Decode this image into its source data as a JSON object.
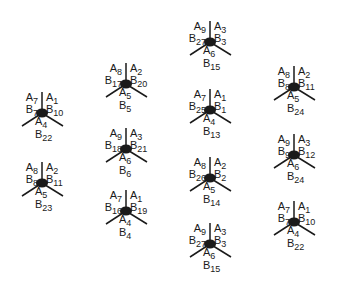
{
  "diagram": {
    "stroke_color": "#1a1a1a",
    "nodes": [
      {
        "x": 42,
        "y": 113,
        "tl": {
          "a": "7",
          "b": "7"
        },
        "tr": {
          "a": "1",
          "b": "10"
        },
        "bottom": {
          "a": "4",
          "b": "22"
        }
      },
      {
        "x": 42,
        "y": 183,
        "tl": {
          "a": "8",
          "b": "8"
        },
        "tr": {
          "a": "2",
          "b": "11"
        },
        "bottom": {
          "a": "5",
          "b": "23"
        }
      },
      {
        "x": 126,
        "y": 84,
        "tl": {
          "a": "8",
          "b": "17"
        },
        "tr": {
          "a": "2",
          "b": "20"
        },
        "bottom": {
          "a": "5",
          "b": "5"
        }
      },
      {
        "x": 126,
        "y": 149,
        "tl": {
          "a": "9",
          "b": "18"
        },
        "tr": {
          "a": "3",
          "b": "21"
        },
        "bottom": {
          "a": "6",
          "b": "6"
        }
      },
      {
        "x": 126,
        "y": 211,
        "tl": {
          "a": "7",
          "b": "16"
        },
        "tr": {
          "a": "1",
          "b": "19"
        },
        "bottom": {
          "a": "4",
          "b": "4"
        }
      },
      {
        "x": 210,
        "y": 42,
        "tl": {
          "a": "9",
          "b": "27"
        },
        "tr": {
          "a": "3",
          "b": "3"
        },
        "bottom": {
          "a": "6",
          "b": "15"
        }
      },
      {
        "x": 210,
        "y": 110,
        "tl": {
          "a": "7",
          "b": "25"
        },
        "tr": {
          "a": "1",
          "b": "1"
        },
        "bottom": {
          "a": "4",
          "b": "13"
        }
      },
      {
        "x": 210,
        "y": 178,
        "tl": {
          "a": "8",
          "b": "26"
        },
        "tr": {
          "a": "2",
          "b": "2"
        },
        "bottom": {
          "a": "5",
          "b": "14"
        }
      },
      {
        "x": 210,
        "y": 244,
        "tl": {
          "a": "9",
          "b": "27"
        },
        "tr": {
          "a": "3",
          "b": "3"
        },
        "bottom": {
          "a": "6",
          "b": "15"
        }
      },
      {
        "x": 294,
        "y": 87,
        "tl": {
          "a": "8",
          "b": "8"
        },
        "tr": {
          "a": "2",
          "b": "11"
        },
        "bottom": {
          "a": "5",
          "b": "24"
        }
      },
      {
        "x": 294,
        "y": 155,
        "tl": {
          "a": "9",
          "b": "9"
        },
        "tr": {
          "a": "3",
          "b": "12"
        },
        "bottom": {
          "a": "6",
          "b": "24"
        }
      },
      {
        "x": 294,
        "y": 222,
        "tl": {
          "a": "7",
          "b": "7"
        },
        "tr": {
          "a": "1",
          "b": "10"
        },
        "bottom": {
          "a": "4",
          "b": "22"
        }
      }
    ]
  },
  "letters": {
    "a": "A",
    "b": "B"
  }
}
